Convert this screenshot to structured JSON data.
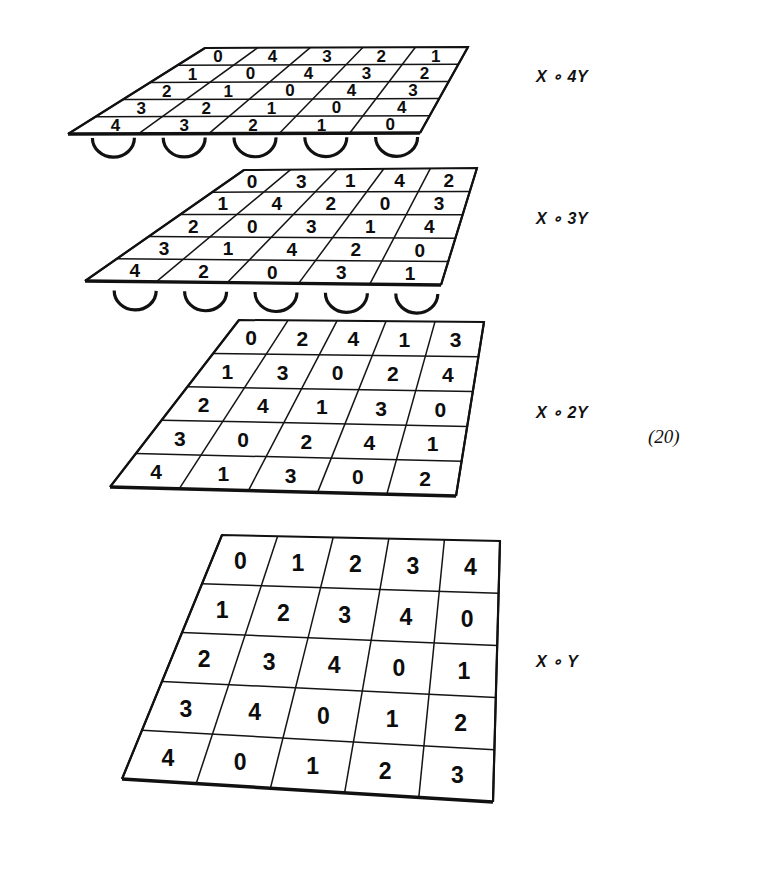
{
  "figure": {
    "equation_number": "(20)",
    "ink_color": "#111111",
    "background_color": "#ffffff",
    "layers": [
      {
        "id": "x-4y",
        "label": "X ∘ 4Y",
        "has_supports": true,
        "support_count": 5,
        "rows": [
          [
            "0",
            "4",
            "3",
            "2",
            "1"
          ],
          [
            "1",
            "0",
            "4",
            "3",
            "2"
          ],
          [
            "2",
            "1",
            "0",
            "4",
            "3"
          ],
          [
            "3",
            "2",
            "1",
            "0",
            "4"
          ],
          [
            "4",
            "3",
            "2",
            "1",
            "0"
          ]
        ]
      },
      {
        "id": "x-3y",
        "label": "X ∘ 3Y",
        "has_supports": true,
        "support_count": 5,
        "rows": [
          [
            "0",
            "3",
            "1",
            "4",
            "2"
          ],
          [
            "1",
            "4",
            "2",
            "0",
            "3"
          ],
          [
            "2",
            "0",
            "3",
            "1",
            "4"
          ],
          [
            "3",
            "1",
            "4",
            "2",
            "0"
          ],
          [
            "4",
            "2",
            "0",
            "3",
            "1"
          ]
        ]
      },
      {
        "id": "x-2y",
        "label": "X ∘ 2Y",
        "has_supports": false,
        "support_count": 0,
        "rows": [
          [
            "0",
            "2",
            "4",
            "1",
            "3"
          ],
          [
            "1",
            "3",
            "0",
            "2",
            "4"
          ],
          [
            "2",
            "4",
            "1",
            "3",
            "0"
          ],
          [
            "3",
            "0",
            "2",
            "4",
            "1"
          ],
          [
            "4",
            "1",
            "3",
            "0",
            "2"
          ]
        ]
      },
      {
        "id": "x-y",
        "label": "X ∘ Y",
        "has_supports": false,
        "support_count": 0,
        "rows": [
          [
            "0",
            "1",
            "2",
            "3",
            "4"
          ],
          [
            "1",
            "2",
            "3",
            "4",
            "0"
          ],
          [
            "2",
            "3",
            "4",
            "0",
            "1"
          ],
          [
            "3",
            "4",
            "0",
            "1",
            "2"
          ],
          [
            "4",
            "0",
            "1",
            "2",
            "3"
          ]
        ]
      }
    ]
  },
  "geometry": {
    "plates": [
      {
        "id": "x-4y",
        "corners": {
          "tl": [
            205,
            48
          ],
          "tr": [
            468,
            47
          ],
          "br": [
            420,
            133
          ],
          "bl": [
            68,
            134
          ]
        },
        "font_size": 17,
        "label_pos": [
          536,
          77
        ],
        "supports": {
          "y": 138,
          "x_start": 78,
          "x_end": 432,
          "radius": 21
        }
      },
      {
        "id": "x-3y",
        "corners": {
          "tl": [
            244,
            170
          ],
          "tr": [
            477,
            168
          ],
          "br": [
            441,
            285
          ],
          "bl": [
            85,
            281
          ]
        },
        "font_size": 19,
        "label_pos": [
          536,
          219
        ],
        "supports": {
          "y": 290,
          "x_start": 100,
          "x_end": 452,
          "radius": 21
        }
      },
      {
        "id": "x-2y",
        "corners": {
          "tl": [
            239,
            320
          ],
          "tr": [
            484,
            322
          ],
          "br": [
            456,
            496
          ],
          "bl": [
            110,
            487
          ]
        },
        "font_size": 21,
        "label_pos": [
          536,
          413
        ],
        "supports": null
      },
      {
        "id": "x-y",
        "corners": {
          "tl": [
            222,
            535
          ],
          "tr": [
            500,
            541
          ],
          "br": [
            493,
            802
          ],
          "bl": [
            122,
            779
          ]
        },
        "font_size": 23,
        "label_pos": [
          536,
          662
        ],
        "supports": null
      }
    ],
    "equation_pos": [
      648,
      438
    ]
  }
}
